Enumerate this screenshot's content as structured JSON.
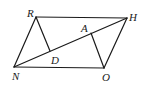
{
  "diagram": {
    "type": "geometry",
    "points": {
      "R": {
        "x": 36,
        "y": 17,
        "label": "R"
      },
      "H": {
        "x": 127,
        "y": 18,
        "label": "H"
      },
      "O": {
        "x": 104,
        "y": 68,
        "label": "O"
      },
      "N": {
        "x": 14,
        "y": 67,
        "label": "N"
      },
      "A": {
        "x": 91,
        "y": 33,
        "label": "A"
      },
      "D": {
        "x": 50,
        "y": 51,
        "label": "D"
      }
    },
    "segments": [
      [
        "R",
        "H"
      ],
      [
        "H",
        "O"
      ],
      [
        "O",
        "N"
      ],
      [
        "N",
        "R"
      ],
      [
        "N",
        "H"
      ],
      [
        "R",
        "D"
      ],
      [
        "O",
        "A"
      ]
    ],
    "labels": {
      "R": "R",
      "H": "H",
      "A": "A",
      "D": "D",
      "N": "N",
      "O": "O"
    }
  }
}
